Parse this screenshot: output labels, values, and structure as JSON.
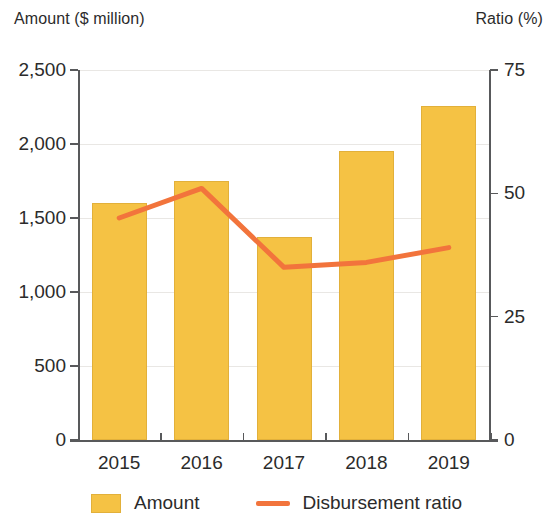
{
  "chart_data": {
    "type": "bar",
    "title": "",
    "subtitle": "",
    "xlabel": "",
    "ylabel": "Amount ($ million)",
    "y2label": "Ratio (%)",
    "categories": [
      "2015",
      "2016",
      "2017",
      "2018",
      "2019"
    ],
    "grid": true,
    "legend_position": "bottom",
    "ylim": [
      0,
      2500
    ],
    "y2lim": [
      0,
      75
    ],
    "yticks": [
      "0",
      "500",
      "1,000",
      "1,500",
      "2,000",
      "2,500"
    ],
    "ytick_values": [
      0,
      500,
      1000,
      1500,
      2000,
      2500
    ],
    "y2ticks": [
      "0",
      "25",
      "50",
      "75"
    ],
    "y2tick_values": [
      0,
      25,
      50,
      75
    ],
    "series": [
      {
        "name": "Amount",
        "type": "bar",
        "axis": "left",
        "unit": "$ million",
        "color": "#F5C244",
        "values": [
          1600,
          1750,
          1370,
          1950,
          2260
        ]
      },
      {
        "name": "Disbursement ratio",
        "type": "line",
        "axis": "right",
        "unit": "%",
        "color": "#F2743C",
        "values": [
          45,
          51,
          35,
          36,
          39
        ]
      }
    ]
  },
  "axes": {
    "left_title": "Amount ($ million)",
    "right_title": "Ratio (%)"
  },
  "legend": {
    "items": [
      {
        "label": "Amount",
        "marker": "bar-swatch",
        "color": "#F5C244"
      },
      {
        "label": "Disbursement ratio",
        "marker": "line-swatch",
        "color": "#F2743C"
      }
    ]
  }
}
